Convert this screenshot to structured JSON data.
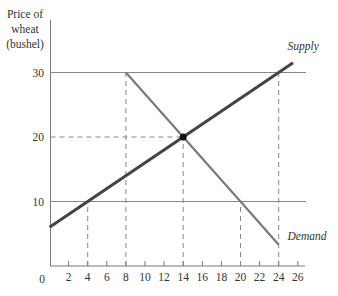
{
  "chart_data": {
    "type": "line",
    "title": "",
    "ylabel_lines": [
      "Price of",
      "wheat",
      "(bushel)"
    ],
    "xlabel": "",
    "origin_label": "0",
    "x_ticks": [
      2,
      4,
      6,
      8,
      10,
      12,
      14,
      16,
      18,
      20,
      22,
      24,
      26
    ],
    "y_ticks": [
      10,
      20,
      30
    ],
    "xlim": [
      0,
      27
    ],
    "ylim": [
      0,
      38
    ],
    "grid": false,
    "reference_lines": {
      "horizontal_solid": [
        10,
        30
      ],
      "horizontal_dashed": [
        {
          "y": 20,
          "x_from": 0,
          "x_to": 14
        }
      ],
      "vertical_dashed": [
        {
          "x": 4,
          "y_to": 10
        },
        {
          "x": 8,
          "y_to": 30
        },
        {
          "x": 14,
          "y_to": 20
        },
        {
          "x": 20,
          "y_to": 10
        },
        {
          "x": 24,
          "y_to": 30
        }
      ]
    },
    "series": [
      {
        "name": "Supply",
        "x": [
          0,
          4,
          14,
          24,
          25.5
        ],
        "y": [
          6,
          10,
          20,
          30,
          31.5
        ],
        "color": "#444444"
      },
      {
        "name": "Demand",
        "x": [
          8,
          14,
          20,
          24
        ],
        "y": [
          30,
          20,
          10,
          3.3
        ],
        "color": "#7a7a7a"
      }
    ],
    "annotations": [
      {
        "text": "Supply",
        "x": 24.5,
        "y": 33.5
      },
      {
        "text": "Demand",
        "x": 24.5,
        "y": 4
      },
      {
        "type": "point",
        "label": "equilibrium",
        "x": 14,
        "y": 20
      }
    ]
  }
}
